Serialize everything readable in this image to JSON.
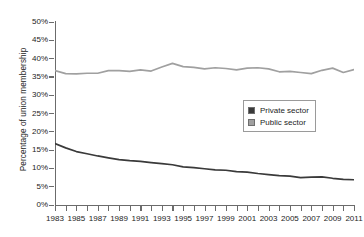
{
  "chart_data": {
    "type": "line",
    "title": "",
    "xlabel": "",
    "ylabel": "Percentage of union membership",
    "xlim": [
      1983,
      2011
    ],
    "ylim": [
      0,
      50
    ],
    "ytick_labels": [
      "50%",
      "45%",
      "40%",
      "35%",
      "30%",
      "25%",
      "20%",
      "15%",
      "10%",
      "5%",
      "0%"
    ],
    "ytick_values": [
      50,
      45,
      40,
      35,
      30,
      25,
      20,
      15,
      10,
      5,
      0
    ],
    "x": [
      1983,
      1984,
      1985,
      1986,
      1987,
      1988,
      1989,
      1990,
      1991,
      1992,
      1993,
      1994,
      1995,
      1996,
      1997,
      1998,
      1999,
      2000,
      2001,
      2002,
      2003,
      2004,
      2005,
      2006,
      2007,
      2008,
      2009,
      2010,
      2011
    ],
    "xtick_labels": [
      "1983",
      "1985",
      "1987",
      "1989",
      "1991",
      "1993",
      "1995",
      "1997",
      "1999",
      "2001",
      "2003",
      "2005",
      "2007",
      "2009",
      "2011"
    ],
    "xtick_values": [
      1983,
      1985,
      1987,
      1989,
      1991,
      1993,
      1995,
      1997,
      1999,
      2001,
      2003,
      2005,
      2007,
      2009,
      2011
    ],
    "grid": false,
    "legend_position": "center-right",
    "series": [
      {
        "name": "Private sector",
        "color": "#3a3a3a",
        "values": [
          16.8,
          15.6,
          14.6,
          14.0,
          13.4,
          12.9,
          12.4,
          12.1,
          11.9,
          11.6,
          11.3,
          11.0,
          10.4,
          10.2,
          9.9,
          9.6,
          9.5,
          9.1,
          9.0,
          8.6,
          8.3,
          8.0,
          7.9,
          7.5,
          7.6,
          7.7,
          7.3,
          7.0,
          6.9
        ]
      },
      {
        "name": "Public sector",
        "color": "#a0a0a0",
        "values": [
          36.7,
          35.9,
          35.8,
          36.0,
          36.0,
          36.7,
          36.7,
          36.5,
          36.9,
          36.6,
          37.7,
          38.7,
          37.8,
          37.6,
          37.2,
          37.5,
          37.3,
          36.9,
          37.4,
          37.5,
          37.2,
          36.4,
          36.5,
          36.2,
          35.9,
          36.8,
          37.4,
          36.2,
          37.0
        ]
      }
    ]
  },
  "legend": {
    "items": [
      {
        "label": "Private sector",
        "color": "#3a3a3a"
      },
      {
        "label": "Public sector",
        "color": "#a0a0a0"
      }
    ]
  }
}
